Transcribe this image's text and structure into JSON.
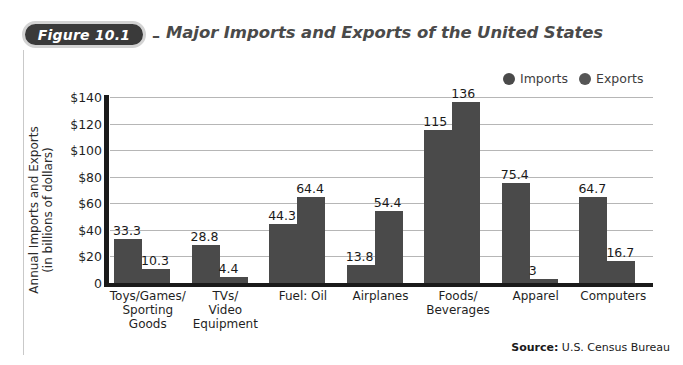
{
  "figure": {
    "badge_label": "Figure 10.1",
    "dash": "–",
    "title": "Major Imports and Exports of the United States"
  },
  "legend": {
    "items": [
      {
        "label": "Imports",
        "color": "#4a4a4a",
        "icon": "circle-marker"
      },
      {
        "label": "Exports",
        "color": "#555555",
        "icon": "circle-marker"
      }
    ]
  },
  "axis": {
    "y_title_line1": "Annual Imports and Exports",
    "y_title_line2": "(in billions of dollars)"
  },
  "source": {
    "bold": "Source:",
    "text": " U.S. Census Bureau"
  },
  "chart_data": {
    "type": "bar",
    "title": "Major Imports and Exports of the United States",
    "xlabel": "",
    "ylabel": "Annual Imports and Exports (in billions of dollars)",
    "ylim": [
      0,
      140
    ],
    "ytick_labels": [
      "$140",
      "$120",
      "$100",
      "$80",
      "$60",
      "$40",
      "$20",
      "0"
    ],
    "ytick_values": [
      140,
      120,
      100,
      80,
      60,
      40,
      20,
      0
    ],
    "grid": true,
    "legend_position": "top-right",
    "categories": [
      "Toys/Games/ Sporting Goods",
      "TVs/ Video Equipment",
      "Fuel: Oil",
      "Airplanes",
      "Foods/ Beverages",
      "Apparel",
      "Computers"
    ],
    "category_lines": [
      [
        "Toys/Games/",
        "Sporting",
        "Goods"
      ],
      [
        "TVs/",
        "Video",
        "Equipment"
      ],
      [
        "Fuel: Oil"
      ],
      [
        "Airplanes"
      ],
      [
        "Foods/",
        "Beverages"
      ],
      [
        "Apparel"
      ],
      [
        "Computers"
      ]
    ],
    "series": [
      {
        "name": "Imports",
        "color": "#4a4a4a",
        "values": [
          33.3,
          28.8,
          44.3,
          13.8,
          115,
          75.4,
          64.7
        ],
        "labels": [
          "33.3",
          "28.8",
          "44.3",
          "13.8",
          "115",
          "75.4",
          "64.7"
        ]
      },
      {
        "name": "Exports",
        "color": "#4a4a4a",
        "values": [
          10.3,
          4.4,
          64.4,
          54.4,
          136,
          3,
          16.7
        ],
        "labels": [
          "10.3",
          "4.4",
          "64.4",
          "54.4",
          "136",
          "3",
          "16.7"
        ]
      }
    ]
  }
}
